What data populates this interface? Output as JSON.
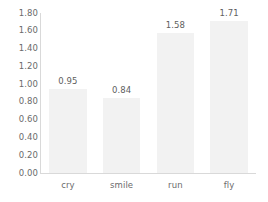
{
  "chart_data": {
    "type": "bar",
    "title": "",
    "subtitle": "",
    "xlabel": "",
    "ylabel": "",
    "categories": [
      "cry",
      "smile",
      "run",
      "fly"
    ],
    "values": [
      0.95,
      0.84,
      1.58,
      1.71
    ],
    "value_labels": [
      "0.95",
      "0.84",
      "1.58",
      "1.71"
    ],
    "ylim": [
      0.0,
      1.8
    ],
    "ytick_labels": [
      "1.80",
      "1.60",
      "1.40",
      "1.20",
      "1.00",
      "0.80",
      "0.60",
      "0.40",
      "0.20",
      "0.00"
    ],
    "ytick_values": [
      1.8,
      1.6,
      1.4,
      1.2,
      1.0,
      0.8,
      0.6,
      0.4,
      0.2,
      0.0
    ],
    "grid": false,
    "legend": false,
    "legend_position": "none",
    "bar_color": "#f2f2f2",
    "axis_color": "#d9d9d9",
    "text_color": "#6b6b6b",
    "background": "#ffffff"
  }
}
